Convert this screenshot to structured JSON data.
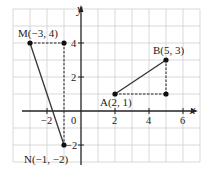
{
  "axes": {
    "x_label": "x",
    "y_label": "y",
    "x_ticks": [
      {
        "value": -2,
        "label": "−2"
      },
      {
        "value": 2,
        "label": "2"
      },
      {
        "value": 4,
        "label": "4"
      },
      {
        "value": 6,
        "label": "6"
      }
    ],
    "y_ticks": [
      {
        "value": 4,
        "label": "4"
      },
      {
        "value": 2,
        "label": "2"
      },
      {
        "value": -2,
        "label": "−2"
      }
    ],
    "origin_label": "0"
  },
  "points": {
    "M": {
      "label": "M(−3, 4)",
      "x": -3,
      "y": 4
    },
    "N": {
      "label": "N(−1, −2)",
      "x": -1,
      "y": -2
    },
    "A": {
      "label": "A(2, 1)",
      "x": 2,
      "y": 1
    },
    "B": {
      "label": "B(5, 3)",
      "x": 5,
      "y": 3
    }
  },
  "segments": [
    {
      "from": "M",
      "to": "N",
      "style": "solid"
    },
    {
      "from": "A",
      "to": "B",
      "style": "solid"
    }
  ],
  "helper_lines": [
    {
      "from": "M",
      "to": "(-1,4)",
      "style": "dashed"
    },
    {
      "from": "(-1,4)",
      "to": "N",
      "style": "dashed"
    },
    {
      "from": "A",
      "to": "(5,1)",
      "style": "dashed"
    },
    {
      "from": "(5,1)",
      "to": "B",
      "style": "dashed"
    }
  ],
  "grid": {
    "x_range": [
      -4,
      7
    ],
    "y_range": [
      -3,
      6
    ],
    "line_color": "#c8c8c8"
  }
}
